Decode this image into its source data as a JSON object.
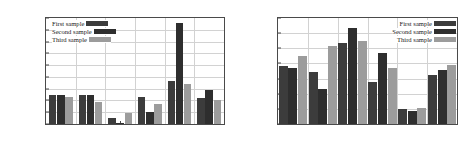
{
  "figure": {
    "panels": [
      {
        "id": "left-panel",
        "ylabel": "Accuracy rate[percentage]",
        "legend": {
          "position": "top-left",
          "entries": [
            {
              "label": "First sample",
              "color": "#3c3c3c"
            },
            {
              "label": "Second sample",
              "color": "#2e2e2e"
            },
            {
              "label": "Third sample",
              "color": "#9c9c9c"
            }
          ]
        },
        "chart_data": {
          "type": "bar",
          "title": "",
          "xlabel": "",
          "ylabel": "Accuracy rate[percentage]",
          "categories": [
            "w/o glove",
            "1",
            "0.7",
            "0.4",
            "0",
            "Average"
          ],
          "series": [
            {
              "name": "First sample",
              "color": "#3c3c3c",
              "values": [
                0.1248,
                0.1248,
                0.1048,
                0.1228,
                0.1362,
                0.1222
              ]
            },
            {
              "name": "Second sample",
              "color": "#2e2e2e",
              "values": [
                0.125,
                0.1243,
                0.1012,
                0.1098,
                0.186,
                0.1285
              ]
            },
            {
              "name": "Third sample",
              "color": "#9c9c9c",
              "values": [
                0.1233,
                0.119,
                0.1095,
                0.1173,
                0.134,
                0.1203
              ]
            }
          ],
          "ylim": [
            0.1,
            0.19
          ],
          "yticks": [
            "0.1",
            "0.11",
            "0.12",
            "0.13",
            "0.14",
            "0.15",
            "0.16",
            "0.17",
            "0.18",
            "0.19"
          ],
          "grid": true,
          "legend_position": "upper left"
        }
      },
      {
        "id": "right-panel",
        "ylabel": "Accuracy rate[percentage]",
        "legend": {
          "position": "top-right",
          "entries": [
            {
              "label": "First sample",
              "color": "#3c3c3c"
            },
            {
              "label": "Second sample",
              "color": "#2e2e2e"
            },
            {
              "label": "Third sample",
              "color": "#9c9c9c"
            }
          ]
        },
        "chart_data": {
          "type": "bar",
          "title": "",
          "xlabel": "",
          "ylabel": "Accuracy rate[percentage]",
          "categories": [
            "w/o glove",
            "1",
            "0.7",
            "0.4",
            "0",
            "Average"
          ],
          "series": [
            {
              "name": "First sample",
              "color": "#3c3c3c",
              "values": [
                0.485,
                0.443,
                0.633,
                0.379,
                0.199,
                0.424
              ]
            },
            {
              "name": "Second sample",
              "color": "#2e2e2e",
              "values": [
                0.472,
                0.333,
                0.737,
                0.57,
                0.187,
                0.455
              ]
            },
            {
              "name": "Third sample",
              "color": "#9c9c9c",
              "values": [
                0.551,
                0.613,
                0.65,
                0.468,
                0.208,
                0.493
              ]
            }
          ],
          "ylim": [
            0.1,
            0.8
          ],
          "yticks": [
            "0.1",
            "0.2",
            "0.3",
            "0.4",
            "0.5",
            "0.6",
            "0.7",
            "0.8"
          ],
          "grid": true,
          "legend_position": "upper right"
        }
      }
    ]
  }
}
